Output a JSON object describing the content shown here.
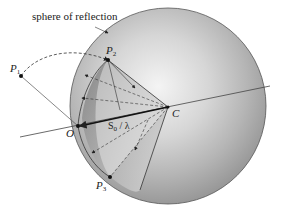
{
  "diagram": {
    "title_label": "sphere of reflection",
    "points": {
      "P1": {
        "name": "P",
        "sub": "1"
      },
      "P2": {
        "name": "P",
        "sub": "2"
      },
      "P3": {
        "name": "P",
        "sub": "3"
      },
      "O": {
        "name": "O"
      },
      "C": {
        "name": "C"
      }
    },
    "vector_label": {
      "name": "S",
      "sub": "0",
      "tail": " / λ"
    },
    "colors": {
      "sphere_light": "#f2f2f2",
      "sphere_dark": "#9a9a9a",
      "cone": "#8c8c8c",
      "line": "#333333"
    }
  }
}
